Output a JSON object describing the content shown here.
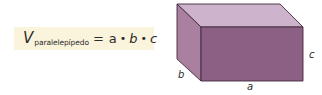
{
  "formula": {
    "variable": "V",
    "subscript": "paralelepípedo",
    "equals": "=",
    "terms": [
      "a",
      "b",
      "c"
    ],
    "operator": "•"
  },
  "figure": {
    "type": "rectangular-prism",
    "labels": {
      "a": "a",
      "b": "b",
      "c": "c"
    },
    "colors": {
      "top_face": "#cdb3cb",
      "side_face": "#a9809f",
      "front_face": "#8c5f84",
      "edge": "#3f2a3c",
      "formula_bg": "#fbf4dc"
    }
  }
}
